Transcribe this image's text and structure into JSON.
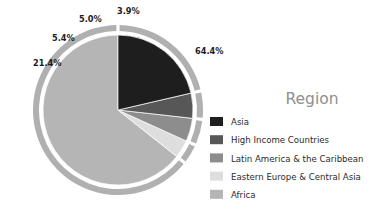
{
  "chart_data": {
    "type": "pie",
    "title": "",
    "legend_title": "Region",
    "legend_position": "right",
    "categories": [
      "Asia",
      "High Income Countries",
      "Latin America & the Caribbean",
      "Eastern Europe & Central Asia",
      "Africa"
    ],
    "values": [
      21.4,
      5.4,
      5.0,
      3.9,
      64.4
    ],
    "value_unit": "%",
    "data_labels": [
      "21.4%",
      "5.4%",
      "5.0%",
      "3.9%",
      "64.4%"
    ],
    "colors": [
      "#1e1e1e",
      "#575757",
      "#8d8d8d",
      "#dedede",
      "#b5b5b5"
    ],
    "slice_order_from_top_counterclockwise": [
      "Africa",
      "Eastern Europe & Central Asia",
      "Latin America & the Caribbean",
      "High Income Countries",
      "Asia"
    ],
    "outer_ring_color": "#b0b0b0",
    "grid": false
  },
  "legend": {
    "title": "Region",
    "items": [
      {
        "label": "Asia",
        "color": "#1e1e1e",
        "value": 21.4,
        "data_label": "21.4%"
      },
      {
        "label": "High Income Countries",
        "color": "#575757",
        "value": 5.4,
        "data_label": "5.4%"
      },
      {
        "label": "Latin America & the Caribbean",
        "color": "#8d8d8d",
        "value": 5.0,
        "data_label": "5.0%"
      },
      {
        "label": "Eastern Europe & Central Asia",
        "color": "#dedede",
        "value": 3.9,
        "data_label": "3.9%"
      },
      {
        "label": "Africa",
        "color": "#b5b5b5",
        "value": 64.4,
        "data_label": "64.4%"
      }
    ]
  },
  "pie_labels": [
    {
      "text": "3.9%",
      "x": 117,
      "y": 14
    },
    {
      "text": "5.0%",
      "x": 79,
      "y": 22
    },
    {
      "text": "5.4%",
      "x": 52,
      "y": 41
    },
    {
      "text": "21.4%",
      "x": 33,
      "y": 66
    },
    {
      "text": "64.4%",
      "x": 195,
      "y": 54
    }
  ]
}
